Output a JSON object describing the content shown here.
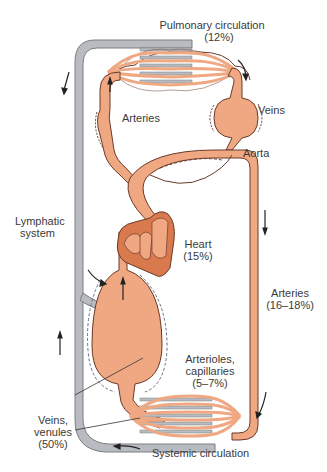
{
  "colors": {
    "vessel_fill": "#f0a882",
    "vessel_stroke": "#6a3a2a",
    "lymph_fill": "#b8bcc0",
    "lymph_stroke": "#7a7e82",
    "heart_fill": "#d9794e",
    "text": "#3a3a3a"
  },
  "labels": {
    "pulmonary": {
      "line1": "Pulmonary circulation",
      "line2": "(12%)"
    },
    "veins_top": "Veins",
    "arteries_top": "Arteries",
    "aorta": "Aorta",
    "lymphatic": {
      "line1": "Lymphatic",
      "line2": "system"
    },
    "heart": {
      "line1": "Heart",
      "line2": "(15%)"
    },
    "arteries_right": {
      "line1": "Arteries",
      "line2": "(16–18%)"
    },
    "arterioles": {
      "line1": "Arterioles,",
      "line2": "capillaries",
      "line3": "(5–7%)"
    },
    "veins_venules": {
      "line1": "Veins,",
      "line2": "venules",
      "line3": "(50%)"
    },
    "systemic": "Systemic circulation"
  }
}
